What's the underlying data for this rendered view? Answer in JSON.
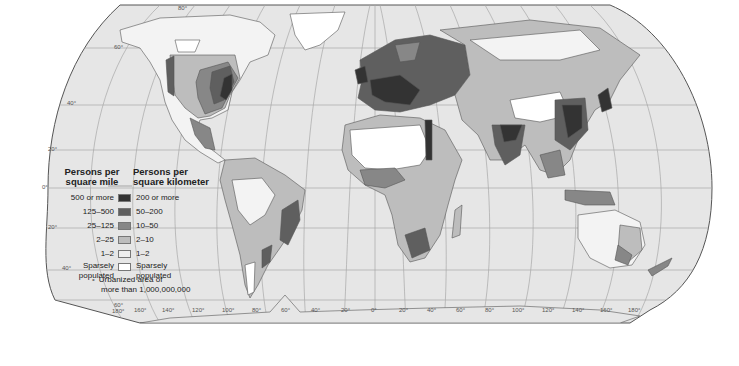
{
  "map": {
    "title": "World Population Density",
    "graticule": {
      "latitude_labels": [
        "80°",
        "60°",
        "40°",
        "20°",
        "0°",
        "20°",
        "40°",
        "60°"
      ],
      "longitude_labels": [
        "180°",
        "160°",
        "140°",
        "120°",
        "100°",
        "80°",
        "60°",
        "40°",
        "20°",
        "0°",
        "20°",
        "40°",
        "60°",
        "80°",
        "100°",
        "120°",
        "140°",
        "160°",
        "180°"
      ]
    },
    "colors": {
      "ocean": "#e6e6e6",
      "graticule": "#a8a8a8",
      "outline": "#555555"
    }
  },
  "legend": {
    "header_mile": "Persons per square mile",
    "header_mile_line1": "Persons per",
    "header_mile_line2": "square mile",
    "header_km_line1": "Persons per",
    "header_km_line2": "square kilometer",
    "classes": [
      {
        "per_mile": "500 or more",
        "per_km": "200 or more",
        "color": "#333333"
      },
      {
        "per_mile": "125–500",
        "per_km": "50–200",
        "color": "#5f5f5f"
      },
      {
        "per_mile": "25–125",
        "per_km": "10–50",
        "color": "#878787"
      },
      {
        "per_mile": "2–25",
        "per_km": "2–10",
        "color": "#bdbdbd"
      },
      {
        "per_mile": "1–2",
        "per_km": "1–2",
        "color": "#eeeeee"
      },
      {
        "per_mile_line1": "Sparsely",
        "per_mile_line2": "populated",
        "per_km_line1": "Sparsely",
        "per_km_line2": "populated",
        "color": "#ffffff"
      }
    ],
    "urban_note_line1": "Urbanized area of",
    "urban_note_line2": "more than 1,000,000,000",
    "urban_symbol": "•"
  }
}
